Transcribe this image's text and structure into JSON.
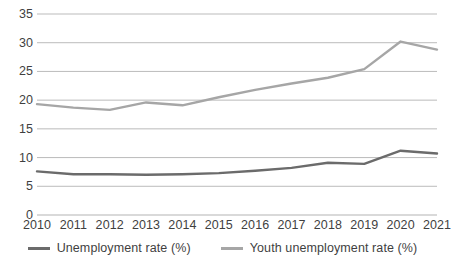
{
  "chart_data": {
    "type": "line",
    "title": "",
    "xlabel": "",
    "ylabel": "",
    "categories": [
      "2010",
      "2011",
      "2012",
      "2013",
      "2014",
      "2015",
      "2016",
      "2017",
      "2018",
      "2019",
      "2020",
      "2021"
    ],
    "x": [
      2010,
      2011,
      2012,
      2013,
      2014,
      2015,
      2016,
      2017,
      2018,
      2019,
      2020,
      2021
    ],
    "series": [
      {
        "name": "Unemployment rate (%)",
        "color": "#6b6b6b",
        "values": [
          7.6,
          7.1,
          7.1,
          7.0,
          7.1,
          7.3,
          7.7,
          8.2,
          9.1,
          8.9,
          11.2,
          10.7
        ]
      },
      {
        "name": "Youth unemployment rate (%)",
        "color": "#a6a6a6",
        "values": [
          19.3,
          18.7,
          18.3,
          19.6,
          19.1,
          20.5,
          21.8,
          22.9,
          23.9,
          25.4,
          30.2,
          28.8
        ]
      }
    ],
    "ylim": [
      0,
      35
    ],
    "yticks": [
      0,
      5,
      10,
      15,
      20,
      25,
      30,
      35
    ],
    "ytick_labels": [
      "0",
      "5",
      "10",
      "15",
      "20",
      "25",
      "30",
      "35"
    ],
    "grid": true,
    "gridline_color": "#b3b3b3",
    "legend_position": "bottom"
  },
  "legend": {
    "entries": [
      {
        "label": "Unemployment rate (%)"
      },
      {
        "label": "Youth unemployment rate (%)"
      }
    ]
  }
}
